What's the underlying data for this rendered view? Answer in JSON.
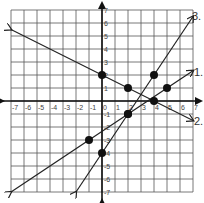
{
  "graph": {
    "x_range": [
      -7,
      7
    ],
    "y_range": [
      -7,
      7
    ],
    "x_tick_labels": [
      "-7",
      "-6",
      "-5",
      "-4",
      "-3",
      "-2",
      "-1",
      "0",
      "1",
      "2",
      "3",
      "4",
      "5",
      "6",
      "7"
    ],
    "y_tick_labels": [
      "7",
      "6",
      "5",
      "4",
      "3",
      "2",
      "1",
      "-1",
      "-2",
      "-3",
      "-4",
      "-5",
      "-6",
      "-7"
    ],
    "lines": [
      {
        "label": "1.",
        "points": [
          [
            -1,
            -3
          ],
          [
            2,
            -1
          ],
          [
            5,
            1
          ]
        ],
        "equation": "y = 2/3 x - 7/3"
      },
      {
        "label": "2.",
        "points": [
          [
            0,
            2
          ],
          [
            2,
            1
          ],
          [
            4,
            0
          ]
        ],
        "equation": "y = -1/2 x + 2"
      },
      {
        "label": "3.",
        "points": [
          [
            0,
            -4
          ],
          [
            2,
            -1
          ],
          [
            4,
            2
          ]
        ],
        "equation": "y = 3/2 x - 4"
      }
    ]
  },
  "labels": {
    "line1": "1.",
    "line2": "2.",
    "line3": "3."
  },
  "header_fragment": "y (p  g  )"
}
